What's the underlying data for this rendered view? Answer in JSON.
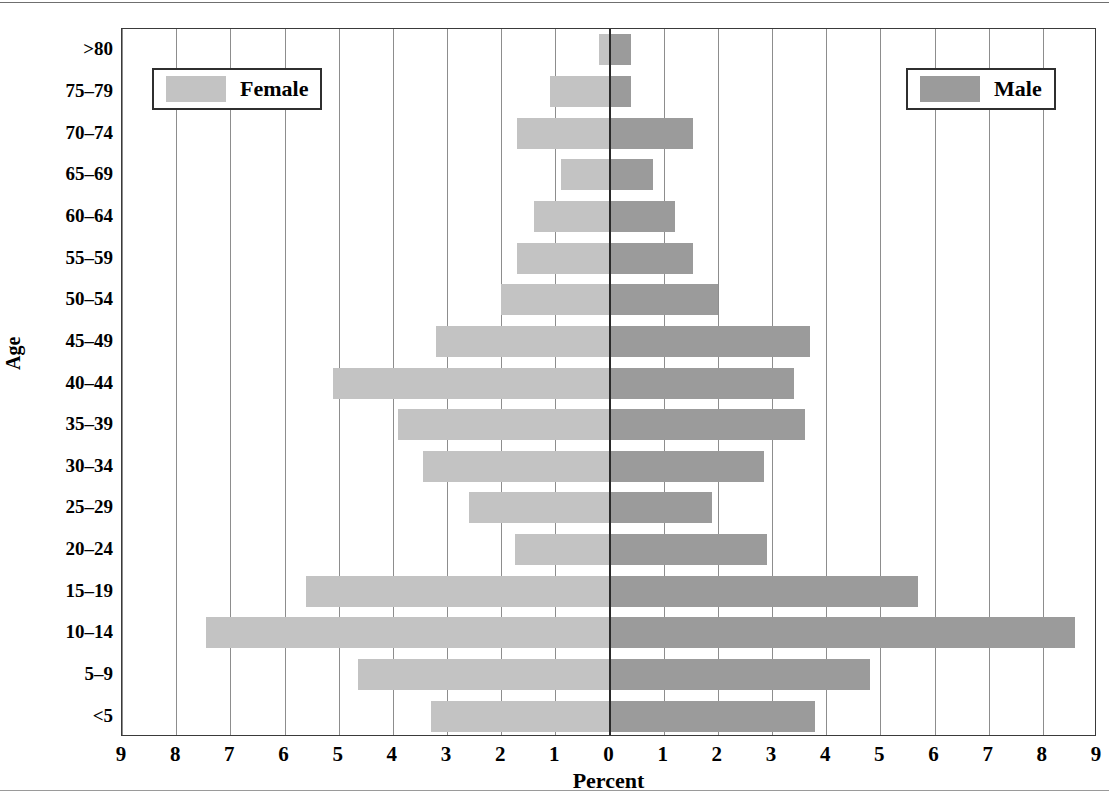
{
  "chart_data": {
    "type": "bar",
    "subtype": "population-pyramid",
    "title": "",
    "xlabel": "Percent",
    "ylabel": "Age",
    "categories": [
      "<5",
      "5–9",
      "10–14",
      "15–19",
      "20–24",
      "25–29",
      "30–34",
      "35–39",
      "40–44",
      "45–49",
      "50–54",
      "55–59",
      "60–64",
      "65–69",
      "70–74",
      "75–79",
      ">80"
    ],
    "series": [
      {
        "name": "Female",
        "side": "left",
        "color": "#c3c3c3",
        "values": [
          3.3,
          4.65,
          7.45,
          5.6,
          1.75,
          2.6,
          3.45,
          3.9,
          5.1,
          3.2,
          2.0,
          1.7,
          1.4,
          0.9,
          1.7,
          1.1,
          0.2
        ]
      },
      {
        "name": "Male",
        "side": "right",
        "color": "#9b9b9b",
        "values": [
          3.8,
          4.8,
          8.6,
          5.7,
          2.9,
          1.9,
          2.85,
          3.6,
          3.4,
          3.7,
          2.0,
          1.55,
          1.2,
          0.8,
          1.55,
          0.4,
          0.4
        ]
      }
    ],
    "xticks_left": [
      "9",
      "8",
      "7",
      "6",
      "5",
      "4",
      "3",
      "2",
      "1"
    ],
    "xtick_center": "0",
    "xticks_right": [
      "1",
      "2",
      "3",
      "4",
      "5",
      "6",
      "7",
      "8",
      "9"
    ],
    "xlim": [
      -9,
      9
    ],
    "xtick_step": 1,
    "grid": true,
    "legend_position": "inside-top-left-and-top-right"
  },
  "axes": {
    "y_title": "Age",
    "x_title": "Percent",
    "y_ticks": [
      "<5",
      "5–9",
      "10–14",
      "15–19",
      "20–24",
      "25–29",
      "30–34",
      "35–39",
      "40–44",
      "45–49",
      "50–54",
      "55–59",
      "60–64",
      "65–69",
      "70–74",
      "75–79",
      ">80"
    ],
    "x_ticks": [
      "9",
      "8",
      "7",
      "6",
      "5",
      "4",
      "3",
      "2",
      "1",
      "0",
      "1",
      "2",
      "3",
      "4",
      "5",
      "6",
      "7",
      "8",
      "9"
    ]
  },
  "legend": {
    "female": {
      "label": "Female",
      "color": "#c3c3c3"
    },
    "male": {
      "label": "Male",
      "color": "#9b9b9b"
    }
  }
}
